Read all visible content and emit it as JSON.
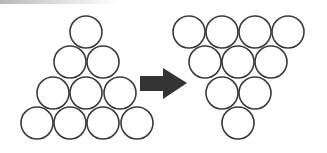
{
  "diagram": {
    "colors": {
      "stroke": "#3a3a3a",
      "arrow": "#333333",
      "background": "#ffffff"
    },
    "radius": 16,
    "left_triangle": {
      "orientation": "point-up",
      "circles": [
        {
          "cx": 86,
          "cy": 32
        },
        {
          "cx": 70,
          "cy": 62
        },
        {
          "cx": 103,
          "cy": 62
        },
        {
          "cx": 53,
          "cy": 93
        },
        {
          "cx": 86,
          "cy": 93
        },
        {
          "cx": 120,
          "cy": 93
        },
        {
          "cx": 37,
          "cy": 123
        },
        {
          "cx": 70,
          "cy": 123
        },
        {
          "cx": 103,
          "cy": 123
        },
        {
          "cx": 137,
          "cy": 123
        }
      ]
    },
    "arrow": {
      "direction": "right",
      "points": "140,76 163,76 163,68 187,83 163,99 163,91 140,91"
    },
    "right_triangle": {
      "orientation": "point-down",
      "circles": [
        {
          "cx": 189,
          "cy": 32
        },
        {
          "cx": 222,
          "cy": 32
        },
        {
          "cx": 255,
          "cy": 32
        },
        {
          "cx": 288,
          "cy": 32
        },
        {
          "cx": 205,
          "cy": 62
        },
        {
          "cx": 238,
          "cy": 62
        },
        {
          "cx": 271,
          "cy": 62
        },
        {
          "cx": 222,
          "cy": 93
        },
        {
          "cx": 255,
          "cy": 93
        },
        {
          "cx": 238,
          "cy": 123
        }
      ]
    }
  }
}
